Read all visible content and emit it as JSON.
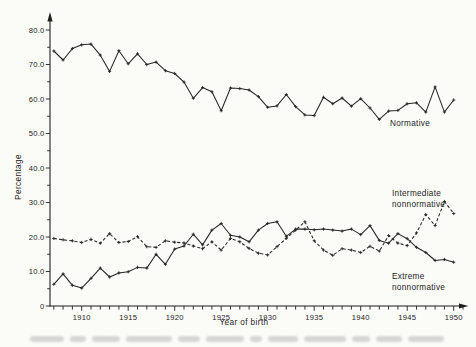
{
  "figure": {
    "y_axis_label": "Percentage",
    "x_axis_label": "Year of birth",
    "annotations": {
      "normative": "Normative",
      "intermediate_line1": "Intermediate",
      "intermediate_line2": "nonnormative",
      "extreme_line1": "Extreme",
      "extreme_line2": "nonnormative"
    },
    "icons": {
      "y_axis_arrow": "up-arrowhead",
      "x_axis_arrow": "right-arrowhead"
    },
    "colors": {
      "ink": "#262626",
      "paper": "#fbfbf8"
    }
  },
  "chart_data": {
    "type": "line",
    "title": "",
    "xlabel": "Year of birth",
    "ylabel": "Percentage",
    "grid": false,
    "legend_position": "inline-annotations",
    "xlim": [
      1906,
      1951
    ],
    "ylim": [
      0,
      84
    ],
    "y_tick_step_minor": 5,
    "y_tick_labels": [
      "80.0",
      "70.0",
      "60.0",
      "50.0",
      "40.0",
      "30.0",
      "20.0",
      "10.0",
      "0"
    ],
    "x_tick_labels": [
      "1910",
      "1915",
      "1920",
      "1925",
      "1930",
      "1935",
      "1940",
      "1945",
      "1950"
    ],
    "x": [
      1907,
      1908,
      1909,
      1910,
      1911,
      1912,
      1913,
      1914,
      1915,
      1916,
      1917,
      1918,
      1919,
      1920,
      1921,
      1922,
      1923,
      1924,
      1925,
      1926,
      1927,
      1928,
      1929,
      1930,
      1931,
      1932,
      1933,
      1934,
      1935,
      1936,
      1937,
      1938,
      1939,
      1940,
      1941,
      1942,
      1943,
      1944,
      1945,
      1946,
      1947,
      1948,
      1949,
      1950
    ],
    "series": [
      {
        "name": "Normative",
        "style": "solid",
        "values": [
          73.9,
          71.3,
          74.6,
          75.7,
          75.9,
          72.7,
          68.0,
          74.0,
          70.2,
          73.1,
          70.0,
          70.7,
          68.2,
          67.4,
          64.9,
          60.2,
          63.3,
          62.1,
          56.6,
          63.2,
          63.0,
          62.6,
          60.7,
          57.6,
          58.0,
          61.3,
          57.8,
          55.4,
          55.2,
          60.5,
          58.6,
          60.3,
          57.9,
          60.1,
          57.4,
          54.1,
          56.5,
          56.7,
          58.6,
          58.9,
          56.2,
          63.5,
          56.2,
          59.7
        ]
      },
      {
        "name": "Intermediate nonnormative",
        "style": "dashed",
        "values": [
          19.6,
          19.2,
          18.9,
          18.4,
          19.3,
          18.2,
          21.0,
          18.4,
          18.7,
          20.1,
          17.2,
          17.0,
          18.9,
          18.5,
          18.3,
          17.4,
          16.6,
          18.6,
          16.2,
          19.6,
          18.6,
          16.7,
          15.3,
          14.8,
          17.2,
          19.6,
          22.0,
          24.4,
          18.9,
          16.2,
          14.7,
          16.6,
          16.2,
          15.5,
          17.3,
          15.9,
          20.4,
          18.2,
          17.5,
          21.2,
          26.5,
          23.3,
          30.3,
          26.8
        ]
      },
      {
        "name": "Extreme nonnormative",
        "style": "solid",
        "values": [
          6.3,
          9.3,
          6.0,
          5.2,
          8.0,
          11.0,
          8.4,
          9.6,
          9.9,
          11.2,
          11.0,
          15.0,
          12.1,
          16.5,
          17.4,
          20.8,
          17.7,
          22.0,
          23.9,
          20.5,
          20.0,
          18.6,
          22.0,
          23.9,
          24.4,
          20.2,
          22.3,
          22.3,
          22.1,
          22.3,
          22.0,
          21.7,
          22.3,
          20.7,
          23.3,
          19.0,
          18.2,
          21.0,
          19.5,
          17.0,
          15.5,
          13.2,
          13.5,
          12.7
        ]
      }
    ]
  }
}
